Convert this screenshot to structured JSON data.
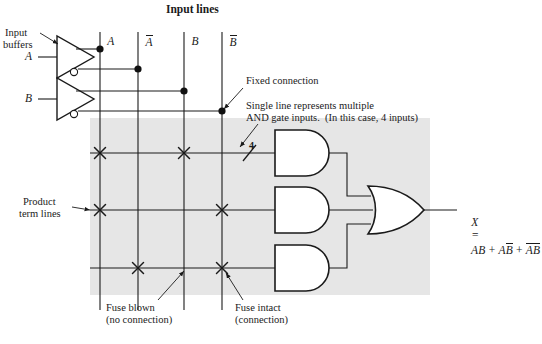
{
  "diagram": {
    "title": "Input lines",
    "canvas": {
      "width": 542,
      "height": 344,
      "background": "#ffffff"
    },
    "shaded_array": {
      "label": "programmable-and-array",
      "color": "#e6e6e6",
      "x": 90,
      "y": 118,
      "width": 340,
      "height": 177
    },
    "labels": {
      "input_buffers_line1": "Input",
      "input_buffers_line2": "buffers",
      "product_term_line1": "Product",
      "product_term_line2": "term lines",
      "fixed_connection": "Fixed connection",
      "multi_input_line1": "Single line represents multiple",
      "multi_input_line2": "AND gate inputs.  (In this case, 4 inputs)",
      "fuse_blown_line1": "Fuse blown",
      "fuse_blown_line2": "(no connection)",
      "fuse_intact_line1": "Fuse intact",
      "fuse_intact_line2": "(connection)",
      "bus_width": "4"
    },
    "inputs": [
      {
        "name": "A",
        "label": "A",
        "y": 57
      },
      {
        "name": "B",
        "label": "B",
        "y": 99
      }
    ],
    "input_lines": [
      {
        "name": "A",
        "label": "A",
        "overbar": false,
        "x": 100,
        "dot_y": 49
      },
      {
        "name": "A_not",
        "label": "A",
        "overbar": true,
        "x": 138,
        "dot_y": 69
      },
      {
        "name": "B",
        "label": "B",
        "overbar": false,
        "x": 184,
        "dot_y": 91
      },
      {
        "name": "B_not",
        "label": "B",
        "overbar": true,
        "x": 222,
        "dot_y": 111
      }
    ],
    "product_terms": [
      {
        "name": "product-term-1",
        "y": 153,
        "fuses": [
          "A",
          "B"
        ]
      },
      {
        "name": "product-term-2",
        "y": 210,
        "fuses": [
          "A",
          "B_not"
        ]
      },
      {
        "name": "product-term-3",
        "y": 268,
        "fuses": [
          "A_not",
          "B_not"
        ]
      }
    ],
    "and_gates": [
      {
        "name": "and-gate-1",
        "x": 275,
        "y": 130,
        "width": 62,
        "height": 46
      },
      {
        "name": "and-gate-2",
        "x": 275,
        "y": 187,
        "width": 62,
        "height": 46
      },
      {
        "name": "and-gate-3",
        "x": 275,
        "y": 245,
        "width": 62,
        "height": 46
      }
    ],
    "or_gate": {
      "name": "or-gate",
      "x": 368,
      "y": 186,
      "width": 56,
      "height": 48
    },
    "output": {
      "name": "X",
      "expression_text": "X = AB + AB̄ + ĀB̄",
      "lhs": "X",
      "equals": "=",
      "terms": [
        {
          "vars": [
            {
              "ch": "A",
              "bar": false
            },
            {
              "ch": "B",
              "bar": false
            }
          ]
        },
        {
          "vars": [
            {
              "ch": "A",
              "bar": false
            },
            {
              "ch": "B",
              "bar": true
            }
          ]
        },
        {
          "vars": [
            {
              "ch": "A",
              "bar": true
            },
            {
              "ch": "B",
              "bar": true
            }
          ]
        }
      ],
      "plus": "+"
    }
  }
}
